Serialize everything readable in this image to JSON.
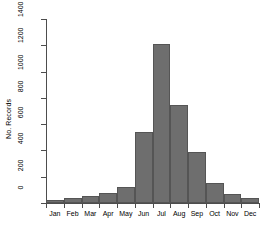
{
  "chart_data": {
    "type": "bar",
    "title": "",
    "subtitle": "",
    "xlabel": "",
    "ylabel": "No. Records",
    "categories": [
      "Jan",
      "Feb",
      "Mar",
      "Apr",
      "May",
      "Jun",
      "Jul",
      "Aug",
      "Sep",
      "Oct",
      "Nov",
      "Dec"
    ],
    "values": [
      20,
      40,
      55,
      75,
      125,
      540,
      1210,
      745,
      385,
      150,
      70,
      40
    ],
    "ylim": [
      0,
      1400
    ],
    "yticks": [
      0,
      200,
      400,
      600,
      800,
      1000,
      1200,
      1400
    ],
    "ytick_labels": [
      "0",
      "200",
      "400",
      "600",
      "800",
      "1000",
      "1200",
      "1400"
    ],
    "grid": false,
    "legend": null,
    "bar_color": "#6e6e6e",
    "bar_edge_color": "#555555",
    "axis_color": "#4d4d4d",
    "background": "#ffffff",
    "bars_touching": true
  },
  "axes": {
    "y_title": "No. Records"
  }
}
